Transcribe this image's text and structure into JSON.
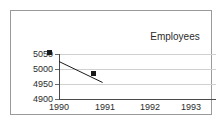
{
  "chart_data": {
    "type": "line",
    "title": "Employees",
    "xlabel": "",
    "ylabel": "",
    "categories": [
      "1990",
      "1991",
      "1992",
      "1993"
    ],
    "x": [
      1990,
      1991,
      1992,
      1993
    ],
    "series": [
      {
        "name": "Employees",
        "values": [
          5025,
          4955,
          null,
          null
        ]
      }
    ],
    "ylim": [
      4900,
      5050
    ],
    "yticks": [
      4900,
      4950,
      5000,
      5050
    ],
    "ytick_labels": [
      "4900",
      "4950",
      "5000",
      "5050"
    ],
    "xlim": [
      1990,
      1993.6
    ],
    "grid": true,
    "legend": "none",
    "marker": "square",
    "line_color": "#1a1a1a",
    "marker_color": "#1a1a1a",
    "grid_color": "#d0d0d0",
    "axis_color": "#4a4a4a",
    "frame_color": "#9a9a9a",
    "background": "#ffffff",
    "text_color": "#2b2b2b"
  }
}
